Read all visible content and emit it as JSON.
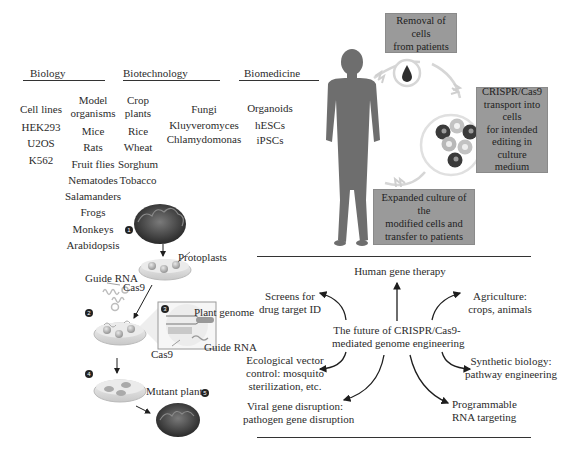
{
  "categories": {
    "biology": {
      "header": "Biology",
      "cell_lines": [
        "Cell lines",
        "HEK293",
        "U2OS",
        "K562"
      ],
      "model_organisms": [
        "Model",
        "organisms",
        "Mice",
        "Rats",
        "Fruit flies",
        "Nematodes",
        "Salamanders",
        "Frogs",
        "Monkeys",
        "Arabidopsis"
      ]
    },
    "biotechnology": {
      "header": "Biotechnology",
      "crop_plants": [
        "Crop",
        "plants",
        "Rice",
        "Wheat",
        "Sorghum",
        "Tobacco"
      ],
      "microbes": [
        "Fungi",
        "Kluyveromyces",
        "Chlamydomonas"
      ]
    },
    "biomedicine": {
      "header": "Biomedicine",
      "items": [
        "Organoids",
        "hESCs",
        "iPSCs"
      ]
    }
  },
  "plant_workflow": {
    "step_numbers": [
      "1",
      "2",
      "3",
      "4",
      "5"
    ],
    "labels": {
      "protoplasts": "Protoplasts",
      "guide_rna": "Guide RNA",
      "cas9": "Cas9",
      "plant_genome": "Plant genome",
      "guide_rna_inset": "Guide RNA",
      "cas9_inset": "Cas9",
      "mutant_plant": "Mutant plant"
    }
  },
  "ex_vivo_therapy": {
    "removal": "Removal of cells from patients",
    "transport_lines": [
      "CRISPR/Cas9",
      "transport into cells",
      "for intended",
      "editing in culture",
      "medium"
    ],
    "expanded_lines": [
      "Expanded culture of the",
      "modified cells and",
      "transfer to patients"
    ],
    "removal_lines": [
      "Removal of cells",
      "from patients"
    ]
  },
  "future_applications": {
    "center": [
      "The future of CRISPR/Cas9-",
      "mediated genome engineering"
    ],
    "human_gene_therapy": "Human gene therapy",
    "screens": [
      "Screens for",
      "drug target ID"
    ],
    "agriculture": [
      "Agriculture:",
      "crops, animals"
    ],
    "ecological": [
      "Ecological vector",
      "control: mosquito",
      "sterilization, etc."
    ],
    "synthetic_biology": [
      "Synthetic biology:",
      "pathway engineering"
    ],
    "viral": [
      "Viral gene disruption:",
      "pathogen gene disruption"
    ],
    "rna_targeting": [
      "Programmable",
      "RNA targeting"
    ]
  },
  "colors": {
    "box_gray": "#9a9a9a",
    "silhouette": "#6e6e6e",
    "cell_dark": "#3a3a3a",
    "cell_light": "#b8b8b8",
    "arrow": "#1e1e1e"
  }
}
